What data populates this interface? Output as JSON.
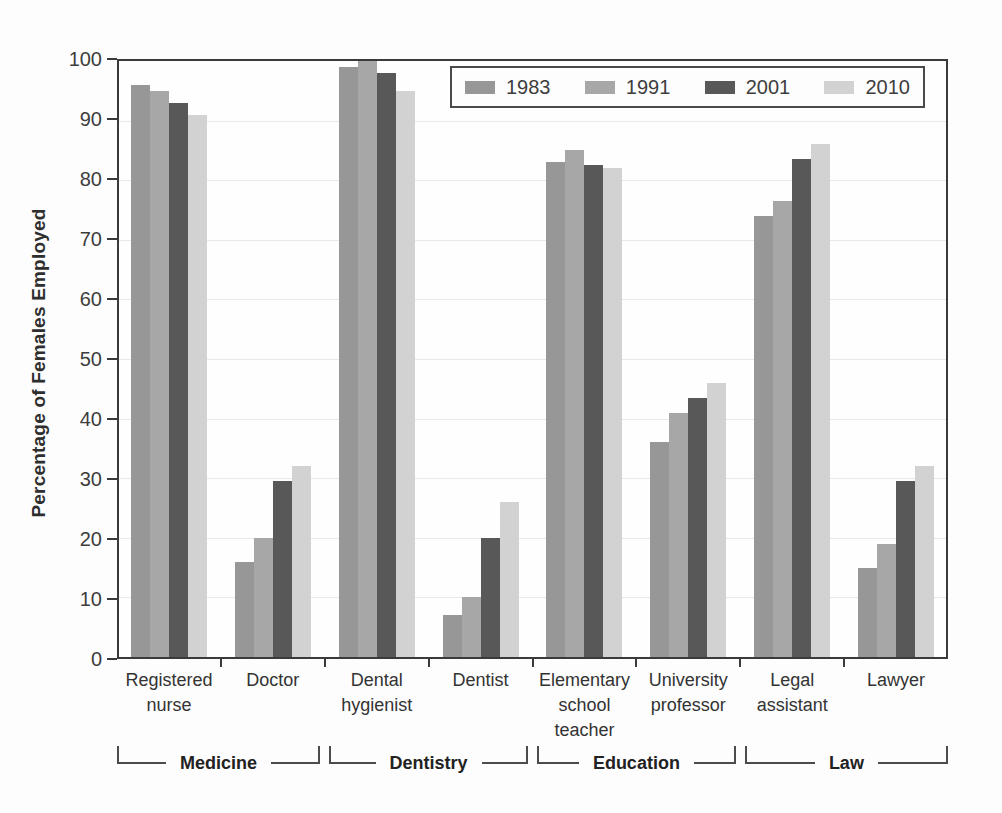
{
  "chart_data": {
    "type": "bar",
    "title": "",
    "xlabel": "",
    "ylabel": "Percentage of Females Employed",
    "ylim": [
      0,
      100
    ],
    "ytick_step": 10,
    "yticks": [
      0,
      10,
      20,
      30,
      40,
      50,
      60,
      70,
      80,
      90,
      100
    ],
    "grid": true,
    "legend_position": "top-right-inside",
    "legend_entries": [
      "1983",
      "1991",
      "2001",
      "2010"
    ],
    "categories": [
      "Registered nurse",
      "Doctor",
      "Dental hygienist",
      "Dentist",
      "Elementary school teacher",
      "University professor",
      "Legal assistant",
      "Lawyer"
    ],
    "category_tick_lines": [
      "Registered\nnurse",
      "Doctor",
      "Dental\nhygienist",
      "Dentist",
      "Elementary\nschool\nteacher",
      "University\nprofessor",
      "Legal\nassistant",
      "Lawyer"
    ],
    "category_groups": [
      {
        "label": "Medicine",
        "from": 0,
        "to": 2
      },
      {
        "label": "Dentistry",
        "from": 2,
        "to": 4
      },
      {
        "label": "Education",
        "from": 4,
        "to": 6
      },
      {
        "label": "Law",
        "from": 6,
        "to": 8
      }
    ],
    "series": [
      {
        "name": "1983",
        "color": "#979797",
        "values": [
          96,
          16,
          99,
          7,
          83,
          36,
          74,
          15
        ]
      },
      {
        "name": "1991",
        "color": "#a7a7a7",
        "values": [
          95,
          20,
          100,
          10,
          85,
          41,
          76.5,
          19
        ]
      },
      {
        "name": "2001",
        "color": "#585858",
        "values": [
          93,
          29.5,
          98,
          20,
          82.5,
          43.5,
          83.5,
          29.5
        ]
      },
      {
        "name": "2010",
        "color": "#d2d2d2",
        "values": [
          91,
          32,
          95,
          26,
          82,
          46,
          86,
          32
        ]
      }
    ]
  },
  "styles": {
    "frame_color": "#3a3a3a",
    "grid_color": "#ece8e8",
    "bracket_color": "#4c4c4c",
    "text_color": "#363636",
    "background": "#fdfdfd"
  }
}
